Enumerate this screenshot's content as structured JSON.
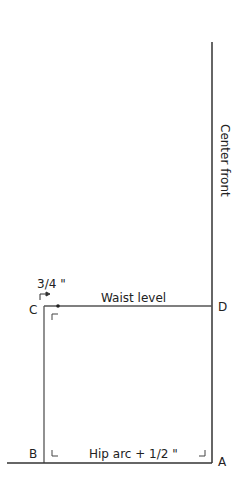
{
  "diagram": {
    "vertical_label": "Center front",
    "waist_label": "Waist level",
    "bottom_label": "Hip arc + 1/2 \"",
    "offset_label": "3/4 \"",
    "points": {
      "A": "A",
      "B": "B",
      "C": "C",
      "D": "D"
    },
    "line_color": "#333333"
  }
}
